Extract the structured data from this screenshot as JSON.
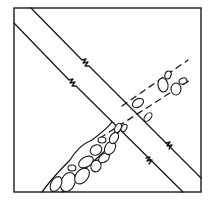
{
  "figure": {
    "stroke_color": "#1a1a1a",
    "background": "#ffffff",
    "frame": {
      "x": 14,
      "y": 8,
      "width": 187,
      "height": 184
    },
    "band_a": {
      "direction": "top-left to bottom-right",
      "upper_line": {
        "start": [
          31,
          8
        ],
        "break": [
          85,
          63
        ],
        "end": [
          201,
          178
        ]
      },
      "lower_line": {
        "start": [
          14,
          23
        ],
        "break": [
          72,
          84
        ],
        "end": [
          183,
          192
        ]
      },
      "break_glyph": "zigzag"
    },
    "band_b": {
      "direction": "bottom-left to top-right",
      "style": "dashed with clusters of rounded pebbles",
      "dense_cluster": "lower-left (x 40-110, y 120-192)",
      "sparse_cluster": "upper-right (x 150-185, y 75-100)"
    }
  }
}
